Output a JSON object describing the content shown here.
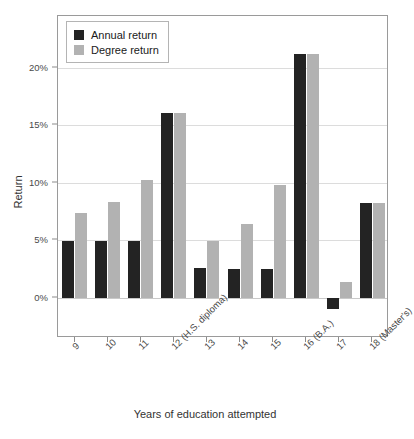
{
  "chart_data": {
    "type": "bar",
    "title": "",
    "xlabel": "Years of education attempted",
    "ylabel": "Return",
    "categories": [
      "9",
      "10",
      "11",
      "12 (H.S. diploma)",
      "13",
      "14",
      "15",
      "16 (B.A.)",
      "17",
      "18 (Master's)"
    ],
    "series": [
      {
        "name": "Annual return",
        "color": "#232323",
        "values": [
          4.9,
          4.9,
          4.9,
          16.1,
          2.6,
          2.5,
          2.5,
          21.2,
          -1.0,
          8.2
        ]
      },
      {
        "name": "Degree return",
        "color": "#b2b2b2",
        "values": [
          7.4,
          8.3,
          10.2,
          16.1,
          4.9,
          6.4,
          9.8,
          21.2,
          1.4,
          8.2
        ]
      }
    ],
    "ylim": [
      -3.5,
      24.5
    ],
    "ytick_values": [
      0,
      5,
      10,
      15,
      20
    ],
    "ytick_labels": [
      "0%",
      "5%",
      "10%",
      "15%",
      "20%"
    ],
    "grid": true,
    "legend_position": "top-left"
  },
  "legend": {
    "entries": [
      {
        "label": "Annual return",
        "swatch": "annual"
      },
      {
        "label": "Degree return",
        "swatch": "degree"
      }
    ]
  }
}
